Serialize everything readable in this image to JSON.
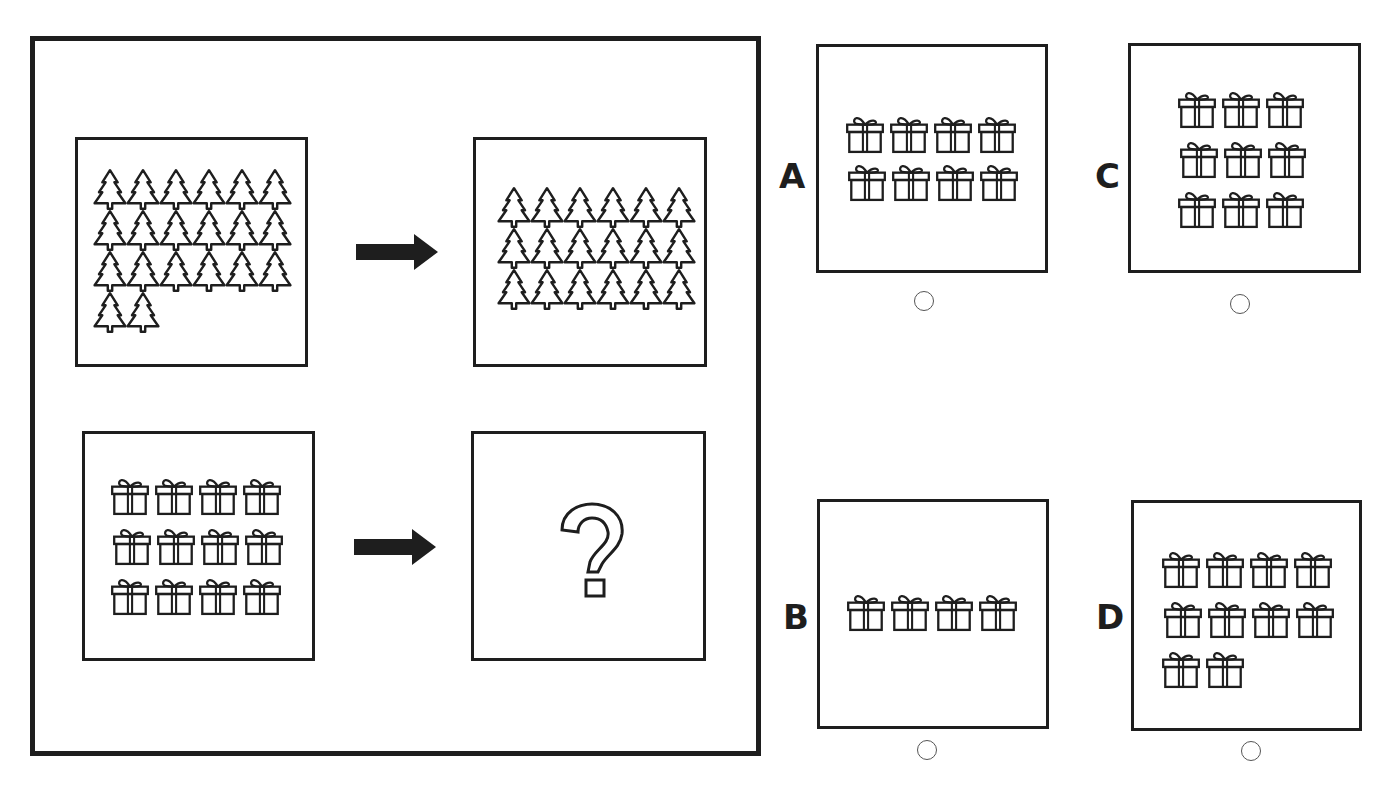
{
  "puzzle": {
    "example": {
      "source": {
        "icon": "tree",
        "count": 20,
        "rows": [
          6,
          6,
          6,
          2
        ]
      },
      "result": {
        "icon": "tree",
        "count": 18,
        "rows": [
          6,
          6,
          6
        ]
      }
    },
    "question": {
      "source": {
        "icon": "gift",
        "count": 12,
        "rows": [
          4,
          4,
          4
        ]
      },
      "result": {
        "symbol": "?"
      }
    },
    "arrow_icon": "right-arrow-icon"
  },
  "options": [
    {
      "label": "A",
      "icon": "gift",
      "count": 8,
      "rows": [
        4,
        4
      ],
      "selected": false
    },
    {
      "label": "B",
      "icon": "gift",
      "count": 4,
      "rows": [
        4
      ],
      "selected": false
    },
    {
      "label": "C",
      "icon": "gift",
      "count": 9,
      "rows": [
        3,
        3,
        3
      ],
      "selected": false
    },
    {
      "label": "D",
      "icon": "gift",
      "count": 10,
      "rows": [
        4,
        4,
        2
      ],
      "selected": false
    }
  ],
  "colors": {
    "stroke": "#1e1e1e",
    "background": "#ffffff",
    "radio_border": "#555555"
  }
}
